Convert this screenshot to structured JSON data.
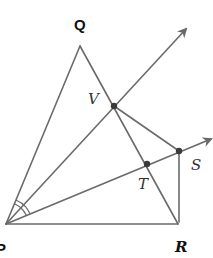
{
  "diagram": {
    "type": "geometry",
    "labels": {
      "Q": "Q",
      "V": "V",
      "S": "S",
      "T": "T",
      "P": "P",
      "R": "R"
    },
    "points": [
      "P",
      "Q",
      "R",
      "V",
      "T",
      "S"
    ],
    "segments": [
      "PQ",
      "QR",
      "PR",
      "VS",
      "SR"
    ],
    "rays": [
      "PV",
      "PS"
    ],
    "marked_points": [
      "V",
      "T",
      "S"
    ],
    "angle_marks": [
      {
        "vertex": "P",
        "between": [
          "PQ",
          "PV"
        ],
        "arcs": 2
      },
      {
        "vertex": "P",
        "between": [
          "PV",
          "PT"
        ],
        "arcs": 2
      }
    ],
    "colors": {
      "line": "#6a6a6a",
      "point": "#3a3a3a",
      "label": "#111111"
    }
  }
}
